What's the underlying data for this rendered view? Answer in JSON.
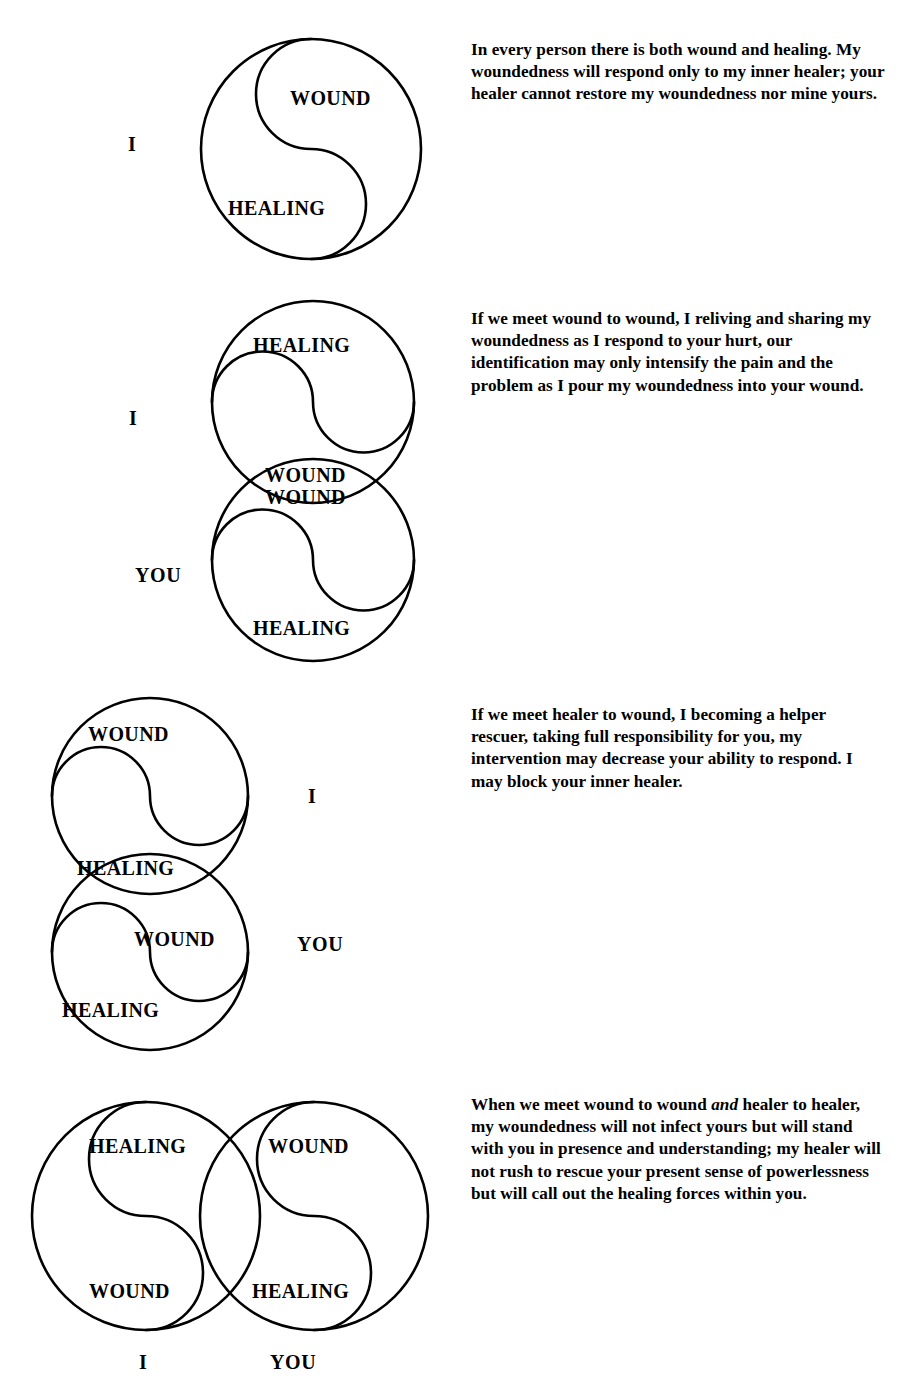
{
  "document": {
    "title": "Wound and Healing — Four Encounter Diagrams",
    "ink_color": "#000000",
    "page_color": "#ffffff"
  },
  "panels": [
    {
      "id": "panel-1",
      "name": "one-person",
      "side_labels": [
        {
          "text": "I",
          "name": "label-i"
        }
      ],
      "circle_labels": [
        {
          "text": "WOUND",
          "name": "label-wound-upper"
        },
        {
          "text": "HEALING",
          "name": "label-healing-lower"
        }
      ],
      "paragraph": "In every person there is both wound and healing. My woundedness will respond only to my inner healer; your healer cannot restore my woundedness nor mine yours."
    },
    {
      "id": "panel-2",
      "name": "wound-to-wound",
      "side_labels": [
        {
          "text": "I",
          "name": "label-i"
        },
        {
          "text": "YOU",
          "name": "label-you"
        }
      ],
      "circle_labels": [
        {
          "text": "HEALING",
          "name": "label-healing-top"
        },
        {
          "text": "WOUND",
          "name": "label-wound-overlap-upper"
        },
        {
          "text": "WOUND",
          "name": "label-wound-overlap-lower"
        },
        {
          "text": "HEALING",
          "name": "label-healing-bottom"
        }
      ],
      "paragraph": "If we meet wound to wound, I reliving and sharing my woundedness as I respond to your hurt, our identification may only intensify the pain and the problem as I pour my woundedness into your wound."
    },
    {
      "id": "panel-3",
      "name": "healer-to-wound",
      "side_labels": [
        {
          "text": "I",
          "name": "label-i"
        },
        {
          "text": "YOU",
          "name": "label-you"
        }
      ],
      "circle_labels": [
        {
          "text": "WOUND",
          "name": "label-wound-top"
        },
        {
          "text": "HEALING",
          "name": "label-healing-overlap"
        },
        {
          "text": "WOUND",
          "name": "label-wound-lower"
        },
        {
          "text": "HEALING",
          "name": "label-healing-bottom"
        }
      ],
      "paragraph": "If we meet healer to wound, I becoming a helper rescuer, taking full responsibility for you, my intervention may decrease your ability to respond. I may block your inner healer."
    },
    {
      "id": "panel-4",
      "name": "wound-to-wound-and-healer-to-healer",
      "side_labels": [
        {
          "text": "I",
          "name": "label-i"
        },
        {
          "text": "YOU",
          "name": "label-you"
        }
      ],
      "circle_labels": [
        {
          "text": "HEALING",
          "name": "label-healing-left-top"
        },
        {
          "text": "WOUND",
          "name": "label-wound-right-top"
        },
        {
          "text": "WOUND",
          "name": "label-wound-left-bottom"
        },
        {
          "text": "HEALING",
          "name": "label-healing-right-bottom"
        }
      ],
      "paragraph_parts": [
        {
          "text": "When we meet wound to wound ",
          "style": "normal"
        },
        {
          "text": "and",
          "style": "italic"
        },
        {
          "text": " healer to healer, my woundedness will not infect yours but will stand with you in presence and understanding; my healer will not rush to rescue your present sense of powerlessness but will call out the healing forces within you.",
          "style": "normal"
        }
      ]
    }
  ]
}
